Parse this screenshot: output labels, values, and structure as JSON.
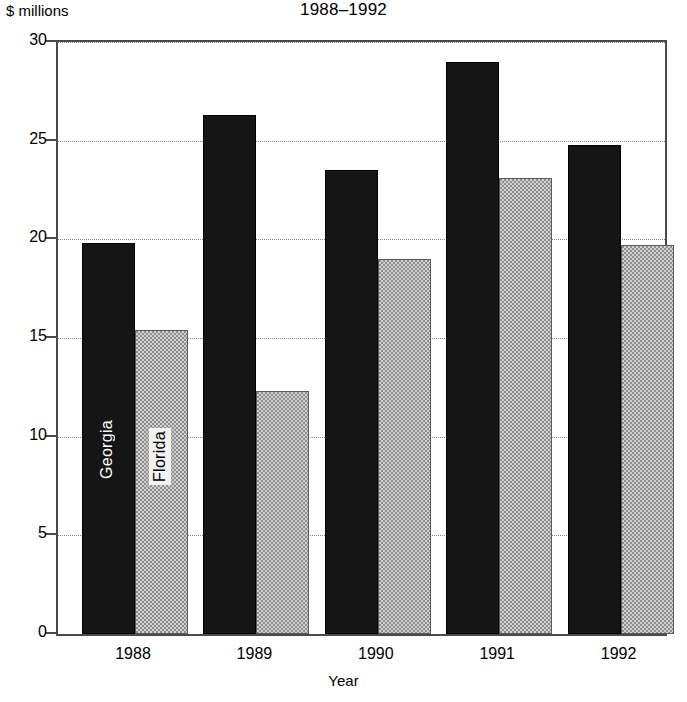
{
  "chart_data": {
    "type": "bar",
    "title": "1988–1992",
    "xlabel": "Year",
    "ylabel": "$ millions",
    "unit_label": "$ millions",
    "categories": [
      "1988",
      "1989",
      "1990",
      "1991",
      "1992"
    ],
    "series": [
      {
        "name": "Georgia",
        "color": "#151515",
        "fill": "solid-black",
        "values": [
          19.8,
          26.3,
          23.5,
          29.0,
          24.8
        ]
      },
      {
        "name": "Florida",
        "color": "#b4b4b4",
        "fill": "gray-checker",
        "values": [
          15.4,
          12.3,
          19.0,
          23.1,
          19.7
        ]
      }
    ],
    "ylim": [
      0,
      30
    ],
    "yticks": [
      0,
      5,
      10,
      15,
      20,
      25,
      30
    ],
    "ytick_labels": [
      "0",
      "5",
      "10",
      "15",
      "20",
      "25",
      "30"
    ],
    "grid": true,
    "grid_axis": "y",
    "grid_style": "dotted",
    "legend": "in-bar-labels",
    "legend_position": "inside-first-group"
  },
  "colors": {
    "georgia": "#151515",
    "florida": "#b4b4b4",
    "axis": "#4a4a4a",
    "grid": "#8d8d8d",
    "background": "#ffffff"
  }
}
